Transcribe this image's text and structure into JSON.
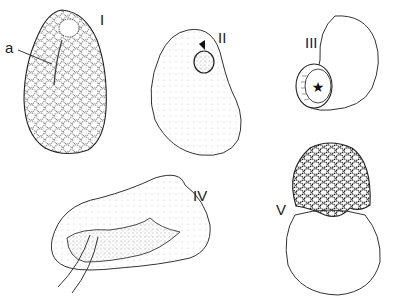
{
  "figure": {
    "panels": [
      {
        "id": "I",
        "label": "I",
        "description": "oval reticulate spore with apical pore",
        "annotation": "a"
      },
      {
        "id": "II",
        "label": "II",
        "description": "kidney-shaped body with circular aperture"
      },
      {
        "id": "III",
        "label": "III",
        "description": "flask-shaped body with stellate opening"
      },
      {
        "id": "IV",
        "label": "IV",
        "description": "elongate folded body with stalk"
      },
      {
        "id": "V",
        "label": "V",
        "description": "globular body capped by reticulate hood"
      }
    ],
    "colors": {
      "ink": "#1a1a1a",
      "paper": "#ffffff"
    }
  }
}
